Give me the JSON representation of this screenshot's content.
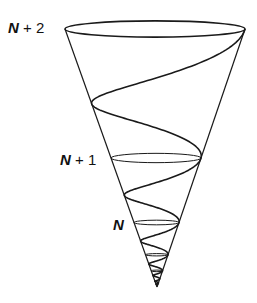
{
  "diagram": {
    "labels": [
      {
        "id": "level-n-plus-2",
        "var": "N",
        "rest": " + 2",
        "x": 8,
        "y": 20
      },
      {
        "id": "level-n-plus-1",
        "var": "N",
        "rest": " + 1",
        "x": 60,
        "y": 152
      },
      {
        "id": "level-n",
        "var": "N",
        "rest": "",
        "x": 113,
        "y": 217
      }
    ],
    "cone": {
      "apex": [
        157,
        287
      ],
      "top_center": [
        155,
        29
      ],
      "top_rx": 90,
      "ellipse_ratio": 0.09,
      "turn_ratio": 0.5,
      "stroke": "#1a1a1a"
    },
    "level_ellipses": [
      {
        "level": "N+2",
        "t": 0
      },
      {
        "level": "N+1",
        "t": 1
      },
      {
        "level": "N",
        "t": 2
      },
      {
        "level": "N-1",
        "t": 3
      },
      {
        "level": "N-2",
        "t": 4
      }
    ],
    "spiral": {
      "turns": 7,
      "samples_per_turn": 120
    }
  }
}
